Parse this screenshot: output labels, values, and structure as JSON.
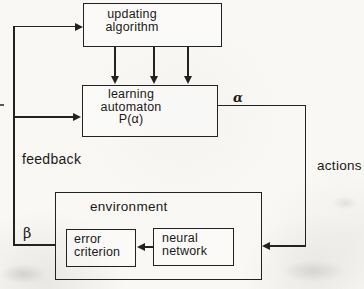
{
  "diagram": {
    "updating_algorithm": {
      "line1": "updating",
      "line2": "algorithm"
    },
    "learning_automaton": {
      "line1": "learning",
      "line2": "automaton",
      "line3": "P(α)"
    },
    "environment": {
      "title": "environment"
    },
    "error_criterion": {
      "line1": "error",
      "line2": "criterion"
    },
    "neural_network": {
      "line1": "neural",
      "line2": "network"
    },
    "edge_labels": {
      "feedback": "feedback",
      "actions": "actions",
      "alpha": "α",
      "beta": "β"
    },
    "colors": {
      "paper": "#f9f8f5",
      "ink": "#222220"
    }
  }
}
